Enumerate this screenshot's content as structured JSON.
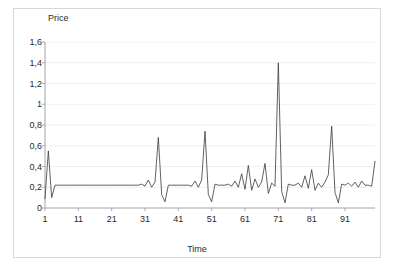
{
  "chart_data": {
    "type": "line",
    "title": "",
    "xlabel": "Time",
    "ylabel": "Price",
    "xlim": [
      1,
      100
    ],
    "ylim": [
      0,
      1.6
    ],
    "grid": true,
    "legend": false,
    "decimal_separator": ",",
    "ytick_labels": [
      "1,6",
      "1,4",
      "1,2",
      "1",
      "0,8",
      "0,6",
      "0,4",
      "0,2",
      "0"
    ],
    "ytick_values": [
      1.6,
      1.4,
      1.2,
      1.0,
      0.8,
      0.6,
      0.4,
      0.2,
      0
    ],
    "xtick_labels": [
      "1",
      "11",
      "21",
      "31",
      "41",
      "51",
      "61",
      "71",
      "81",
      "91"
    ],
    "xtick_values": [
      1,
      11,
      21,
      31,
      41,
      51,
      61,
      71,
      81,
      91
    ],
    "line_color": "#3a3a3a",
    "series": [
      {
        "name": "Price",
        "x": [
          1,
          2,
          3,
          4,
          5,
          6,
          7,
          8,
          9,
          10,
          11,
          12,
          13,
          14,
          15,
          16,
          17,
          18,
          19,
          20,
          21,
          22,
          23,
          24,
          25,
          26,
          27,
          28,
          29,
          30,
          31,
          32,
          33,
          34,
          35,
          36,
          37,
          38,
          39,
          40,
          41,
          42,
          43,
          44,
          45,
          46,
          47,
          48,
          49,
          50,
          51,
          52,
          53,
          54,
          55,
          56,
          57,
          58,
          59,
          60,
          61,
          62,
          63,
          64,
          65,
          66,
          67,
          68,
          69,
          70,
          71,
          72,
          73,
          74,
          75,
          76,
          77,
          78,
          79,
          80,
          81,
          82,
          83,
          84,
          85,
          86,
          87,
          88,
          89,
          90,
          91,
          92,
          93,
          94,
          95,
          96,
          97,
          98,
          99,
          100
        ],
        "values": [
          0.09,
          0.55,
          0.1,
          0.22,
          0.22,
          0.22,
          0.22,
          0.22,
          0.22,
          0.22,
          0.22,
          0.22,
          0.22,
          0.22,
          0.22,
          0.22,
          0.22,
          0.22,
          0.22,
          0.22,
          0.22,
          0.22,
          0.22,
          0.22,
          0.22,
          0.22,
          0.22,
          0.22,
          0.22,
          0.23,
          0.21,
          0.27,
          0.2,
          0.25,
          0.68,
          0.13,
          0.06,
          0.22,
          0.22,
          0.22,
          0.22,
          0.22,
          0.22,
          0.22,
          0.21,
          0.26,
          0.2,
          0.27,
          0.74,
          0.13,
          0.06,
          0.23,
          0.22,
          0.22,
          0.22,
          0.23,
          0.21,
          0.26,
          0.2,
          0.33,
          0.18,
          0.41,
          0.17,
          0.28,
          0.2,
          0.25,
          0.43,
          0.14,
          0.24,
          0.21,
          1.4,
          0.16,
          0.05,
          0.23,
          0.22,
          0.22,
          0.24,
          0.2,
          0.31,
          0.19,
          0.37,
          0.17,
          0.24,
          0.2,
          0.25,
          0.32,
          0.79,
          0.15,
          0.05,
          0.23,
          0.22,
          0.24,
          0.21,
          0.25,
          0.2,
          0.26,
          0.22,
          0.22,
          0.21,
          0.45
        ]
      }
    ]
  }
}
